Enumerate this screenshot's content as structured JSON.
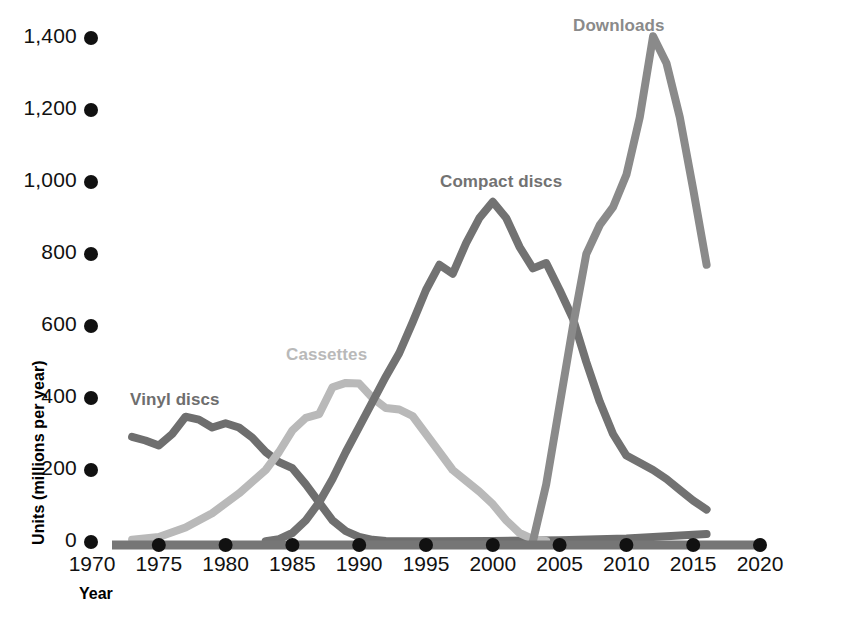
{
  "chart_data": {
    "type": "line",
    "title": "",
    "xlabel": "Year",
    "ylabel": "Units (millions per year)",
    "xlim": [
      1970,
      2020
    ],
    "ylim": [
      0,
      1400
    ],
    "grid": false,
    "legend_position": "inline-labels",
    "x_ticks": [
      "1970",
      "1975",
      "1980",
      "1985",
      "1990",
      "1995",
      "2000",
      "2005",
      "2010",
      "2015",
      "2020"
    ],
    "y_ticks": [
      "0",
      "200",
      "400",
      "600",
      "800",
      "1,000",
      "1,200",
      "1,400"
    ],
    "series": [
      {
        "name": "Vinyl discs",
        "color": "#6e6e6e",
        "label_x": 130,
        "label_y": 390,
        "points": [
          [
            1973,
            292
          ],
          [
            1974,
            282
          ],
          [
            1975,
            268
          ],
          [
            1976,
            300
          ],
          [
            1977,
            348
          ],
          [
            1978,
            340
          ],
          [
            1979,
            318
          ],
          [
            1980,
            330
          ],
          [
            1981,
            318
          ],
          [
            1982,
            290
          ],
          [
            1983,
            250
          ],
          [
            1984,
            222
          ],
          [
            1985,
            205
          ],
          [
            1986,
            160
          ],
          [
            1987,
            110
          ],
          [
            1988,
            60
          ],
          [
            1989,
            30
          ],
          [
            1990,
            14
          ],
          [
            1991,
            6
          ],
          [
            1992,
            3
          ],
          [
            1993,
            2
          ],
          [
            1995,
            2
          ],
          [
            2000,
            3
          ],
          [
            2005,
            5
          ],
          [
            2010,
            10
          ],
          [
            2013,
            16
          ],
          [
            2016,
            22
          ]
        ]
      },
      {
        "name": "Cassettes",
        "color": "#b9b9b9",
        "label_x": 286,
        "label_y": 345,
        "points": [
          [
            1973,
            6
          ],
          [
            1975,
            14
          ],
          [
            1977,
            40
          ],
          [
            1979,
            80
          ],
          [
            1981,
            135
          ],
          [
            1983,
            200
          ],
          [
            1984,
            250
          ],
          [
            1985,
            310
          ],
          [
            1986,
            345
          ],
          [
            1987,
            355
          ],
          [
            1988,
            430
          ],
          [
            1989,
            442
          ],
          [
            1990,
            440
          ],
          [
            1991,
            400
          ],
          [
            1992,
            372
          ],
          [
            1993,
            368
          ],
          [
            1994,
            350
          ],
          [
            1995,
            300
          ],
          [
            1996,
            250
          ],
          [
            1997,
            200
          ],
          [
            1998,
            170
          ],
          [
            1999,
            140
          ],
          [
            2000,
            105
          ],
          [
            2001,
            60
          ],
          [
            2002,
            25
          ],
          [
            2003,
            8
          ],
          [
            2004,
            3
          ]
        ]
      },
      {
        "name": "Compact discs",
        "color": "#727272",
        "label_x": 440,
        "label_y": 172,
        "points": [
          [
            1983,
            2
          ],
          [
            1984,
            8
          ],
          [
            1985,
            25
          ],
          [
            1986,
            60
          ],
          [
            1987,
            110
          ],
          [
            1988,
            175
          ],
          [
            1989,
            250
          ],
          [
            1990,
            320
          ],
          [
            1991,
            390
          ],
          [
            1992,
            460
          ],
          [
            1993,
            525
          ],
          [
            1994,
            610
          ],
          [
            1995,
            700
          ],
          [
            1996,
            770
          ],
          [
            1997,
            745
          ],
          [
            1998,
            830
          ],
          [
            1999,
            900
          ],
          [
            2000,
            945
          ],
          [
            2001,
            900
          ],
          [
            2002,
            820
          ],
          [
            2003,
            760
          ],
          [
            2004,
            775
          ],
          [
            2005,
            700
          ],
          [
            2006,
            620
          ],
          [
            2007,
            500
          ],
          [
            2008,
            390
          ],
          [
            2009,
            300
          ],
          [
            2010,
            240
          ],
          [
            2011,
            220
          ],
          [
            2012,
            200
          ],
          [
            2013,
            175
          ],
          [
            2014,
            145
          ],
          [
            2015,
            115
          ],
          [
            2016,
            90
          ]
        ]
      },
      {
        "name": "Downloads",
        "color": "#8a8a8a",
        "label_x": 573,
        "label_y": 16,
        "points": [
          [
            2003,
            2
          ],
          [
            2004,
            160
          ],
          [
            2005,
            380
          ],
          [
            2006,
            600
          ],
          [
            2007,
            800
          ],
          [
            2008,
            880
          ],
          [
            2009,
            930
          ],
          [
            2010,
            1020
          ],
          [
            2011,
            1180
          ],
          [
            2012,
            1405
          ],
          [
            2013,
            1330
          ],
          [
            2014,
            1180
          ],
          [
            2015,
            980
          ],
          [
            2016,
            770
          ]
        ]
      }
    ]
  },
  "axis": {
    "x_axis_line_color": "#767676",
    "tick_marker_color": "#111111"
  }
}
